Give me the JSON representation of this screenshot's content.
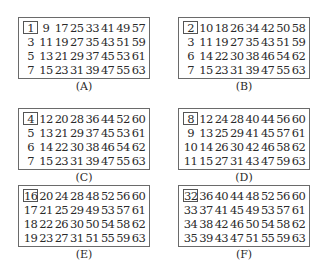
{
  "cards": [
    {
      "label": "(A)",
      "rows": [
        [
          "1",
          "9",
          "17",
          "25",
          "33",
          "41",
          "49",
          "57"
        ],
        [
          "3",
          "11",
          "19",
          "27",
          "35",
          "43",
          "51",
          "59"
        ],
        [
          "5",
          "13",
          "21",
          "29",
          "37",
          "45",
          "53",
          "61"
        ],
        [
          "7",
          "15",
          "23",
          "31",
          "39",
          "47",
          "55",
          "63"
        ]
      ]
    },
    {
      "label": "(B)",
      "rows": [
        [
          "2",
          "10",
          "18",
          "26",
          "34",
          "42",
          "50",
          "58"
        ],
        [
          "3",
          "11",
          "19",
          "27",
          "35",
          "43",
          "51",
          "59"
        ],
        [
          "6",
          "14",
          "22",
          "30",
          "38",
          "46",
          "54",
          "62"
        ],
        [
          "7",
          "15",
          "23",
          "31",
          "39",
          "47",
          "55",
          "63"
        ]
      ]
    },
    {
      "label": "(C)",
      "rows": [
        [
          "4",
          "12",
          "20",
          "28",
          "36",
          "44",
          "52",
          "60"
        ],
        [
          "5",
          "13",
          "21",
          "29",
          "37",
          "45",
          "53",
          "61"
        ],
        [
          "6",
          "14",
          "22",
          "30",
          "38",
          "46",
          "54",
          "62"
        ],
        [
          "7",
          "15",
          "23",
          "31",
          "39",
          "47",
          "55",
          "63"
        ]
      ]
    },
    {
      "label": "(D)",
      "rows": [
        [
          "8",
          "12",
          "24",
          "28",
          "40",
          "44",
          "56",
          "60"
        ],
        [
          "9",
          "13",
          "25",
          "29",
          "41",
          "45",
          "57",
          "61"
        ],
        [
          "10",
          "14",
          "26",
          "30",
          "42",
          "46",
          "58",
          "62"
        ],
        [
          "11",
          "15",
          "27",
          "31",
          "43",
          "47",
          "59",
          "63"
        ]
      ]
    },
    {
      "label": "(E)",
      "rows": [
        [
          "16",
          "20",
          "24",
          "28",
          "48",
          "52",
          "56",
          "60"
        ],
        [
          "17",
          "21",
          "25",
          "29",
          "49",
          "53",
          "57",
          "61"
        ],
        [
          "18",
          "22",
          "26",
          "30",
          "50",
          "54",
          "58",
          "62"
        ],
        [
          "19",
          "23",
          "27",
          "31",
          "51",
          "55",
          "59",
          "63"
        ]
      ]
    },
    {
      "label": "(F)",
      "rows": [
        [
          "32",
          "36",
          "40",
          "44",
          "48",
          "52",
          "56",
          "60"
        ],
        [
          "33",
          "37",
          "41",
          "45",
          "49",
          "53",
          "57",
          "61"
        ],
        [
          "34",
          "38",
          "42",
          "46",
          "50",
          "54",
          "58",
          "62"
        ],
        [
          "35",
          "39",
          "43",
          "47",
          "51",
          "55",
          "59",
          "63"
        ]
      ]
    }
  ]
}
